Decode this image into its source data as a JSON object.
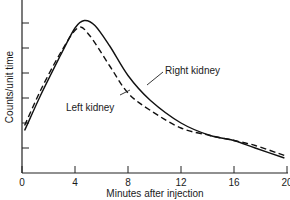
{
  "chart_data": {
    "type": "line",
    "title": "",
    "xlabel": "Minutes after injection",
    "ylabel": "Counts/unit time",
    "xlim": [
      0,
      20
    ],
    "ylim": [
      0,
      7
    ],
    "x_ticks": [
      0,
      4,
      8,
      12,
      16,
      20
    ],
    "x_tick_labels": [
      "0",
      "4",
      "8",
      "12",
      "16",
      "20"
    ],
    "y_ticks": [
      1,
      2,
      3,
      4,
      5,
      6
    ],
    "y_tick_labels": [],
    "grid": false,
    "legend": "inline annotations with leader lines",
    "series": [
      {
        "name": "Right kidney",
        "style": "solid",
        "x": [
          0.2,
          1.4,
          2.9,
          4.0,
          4.7,
          5.5,
          6.6,
          8.0,
          9.7,
          12.0,
          14.2,
          16.0,
          17.6,
          19.8
        ],
        "values": [
          1.7,
          3.1,
          4.7,
          5.8,
          6.1,
          5.9,
          5.1,
          3.9,
          2.9,
          2.0,
          1.5,
          1.3,
          1.0,
          0.6
        ]
      },
      {
        "name": "Left kidney",
        "style": "dashed",
        "x": [
          0.2,
          1.4,
          2.9,
          4.2,
          5.1,
          6.6,
          8.0,
          9.7,
          12.0,
          14.2,
          16.0,
          17.6,
          19.8
        ],
        "values": [
          1.9,
          3.3,
          4.8,
          5.8,
          5.5,
          4.3,
          3.2,
          2.5,
          1.8,
          1.5,
          1.3,
          1.1,
          0.7
        ]
      }
    ],
    "annotations": [
      {
        "text": "Right kidney",
        "target_series": "Right kidney",
        "pointer_to": [
          9.2,
          3.2
        ]
      },
      {
        "text": "Left kidney",
        "target_series": "Left kidney",
        "pointer_to": [
          8.3,
          3.0
        ]
      }
    ]
  },
  "axes": {
    "xlabel": "Minutes after injection",
    "ylabel": "Counts/unit time"
  },
  "labels": {
    "right": "Right kidney",
    "left": "Left kidney"
  }
}
